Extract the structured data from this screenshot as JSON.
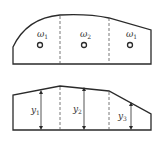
{
  "top_figure": {
    "regions": [
      {
        "label": "ω",
        "sub": "1"
      },
      {
        "label": "ω",
        "sub": "2"
      },
      {
        "label": "ω",
        "sub": "1"
      }
    ]
  },
  "bottom_figure": {
    "heights": [
      {
        "label": "y",
        "sub": "1"
      },
      {
        "label": "y",
        "sub": "2"
      },
      {
        "label": "y",
        "sub": "3"
      }
    ]
  },
  "colors": {
    "stroke": "#2a2a2a",
    "background": "#ffffff"
  }
}
